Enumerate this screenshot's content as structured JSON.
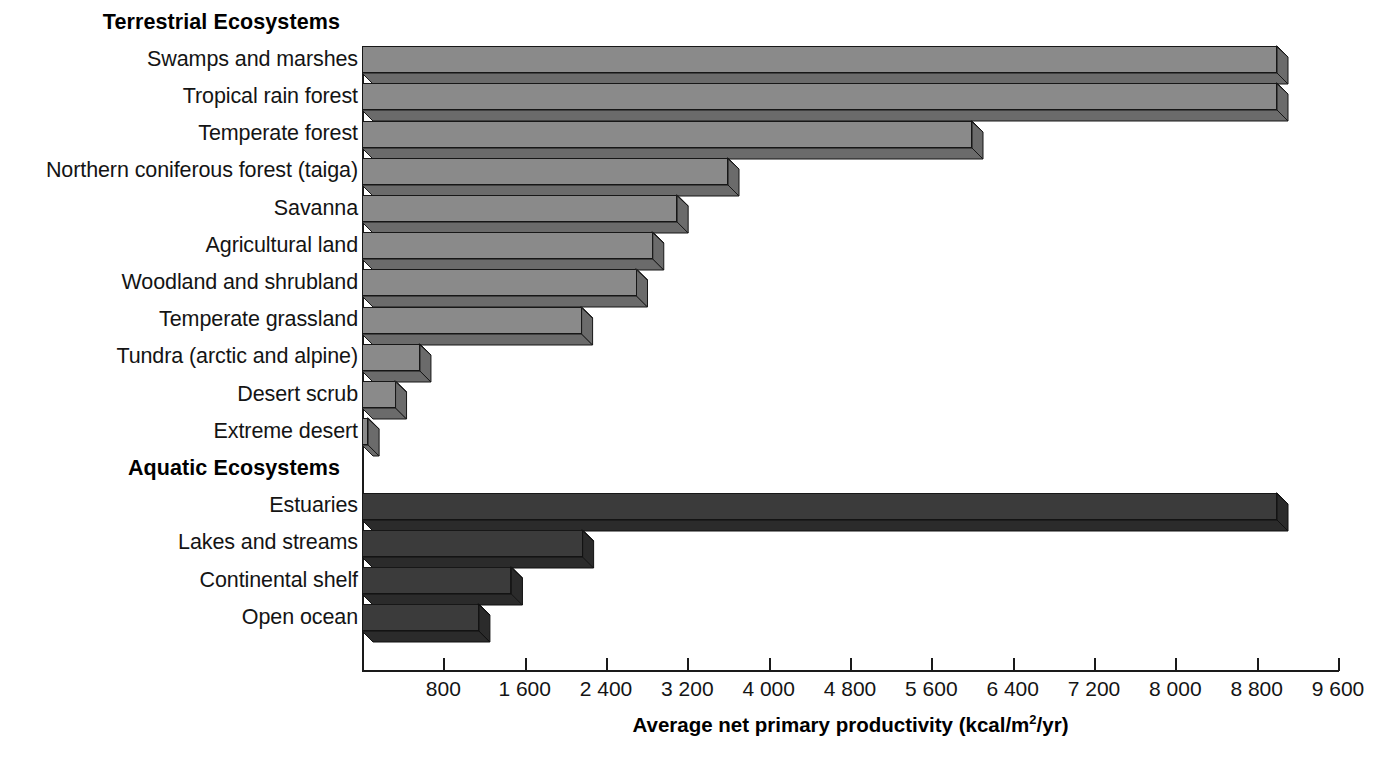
{
  "chart_data": {
    "type": "bar",
    "orientation": "horizontal",
    "title": "",
    "xlabel": "Average net primary productivity (kcal/m2/yr)",
    "xlabel_parts": {
      "main": "Average net primary productivity (kcal/m",
      "sup": "2",
      "tail": "/yr)"
    },
    "ylabel": "",
    "xlim": [
      0,
      9600
    ],
    "xtick_values": [
      800,
      1600,
      2400,
      3200,
      4000,
      4800,
      5600,
      6400,
      7200,
      8000,
      8800,
      9600
    ],
    "xtick_labels": [
      "800",
      "1 600",
      "2 400",
      "3 200",
      "4 000",
      "4 800",
      "5 600",
      "6 400",
      "7 200",
      "8 000",
      "8 800",
      "9 600"
    ],
    "grid": false,
    "legend": "none",
    "groups": [
      {
        "name": "Terrestrial Ecosystems",
        "color": "#8a8a8a",
        "categories": [
          "Swamps and marshes",
          "Tropical rain forest",
          "Temperate forest",
          "Northern coniferous forest (taiga)",
          "Savanna",
          "Agricultural land",
          "Woodland and shrubland",
          "Temperate grassland",
          "Tundra (arctic and alpine)",
          "Desert scrub",
          "Extreme desert"
        ],
        "values": [
          9000,
          9000,
          6000,
          3600,
          3100,
          2860,
          2700,
          2160,
          570,
          330,
          60
        ]
      },
      {
        "name": "Aquatic Ecosystems",
        "color": "#3b3b3b",
        "categories": [
          "Estuaries",
          "Lakes and streams",
          "Continental shelf",
          "Open ocean"
        ],
        "values": [
          9000,
          2170,
          1470,
          1150
        ]
      }
    ]
  }
}
